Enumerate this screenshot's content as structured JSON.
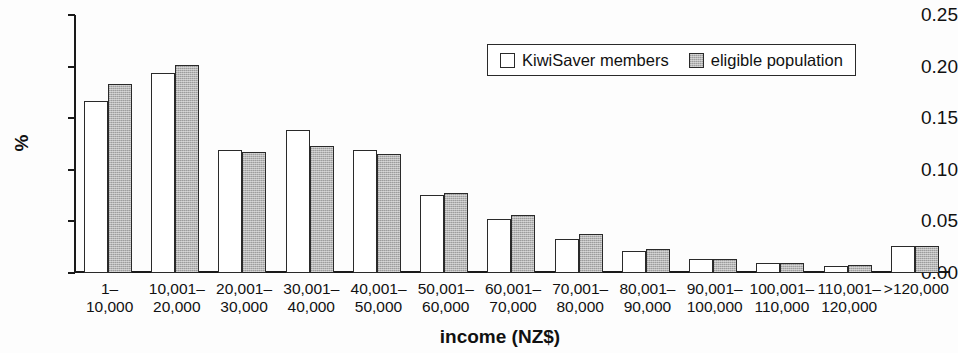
{
  "chart_data": {
    "type": "bar",
    "title": "",
    "xlabel": "income (NZ$)",
    "ylabel": "%",
    "ylim": [
      0.0,
      0.25
    ],
    "ytick_labels": [
      "0.25",
      "0.20",
      "0.15",
      "0.10",
      "0.05",
      "0.00"
    ],
    "ytick_values": [
      0.25,
      0.2,
      0.15,
      0.1,
      0.05,
      0.0
    ],
    "grid": false,
    "legend_position": "upper right inside",
    "categories": [
      "1–\n10,000",
      "10,001–\n20,000",
      "20,001–\n30,000",
      "30,001–\n40,000",
      "40,001–\n50,000",
      "50,001–\n60,000",
      "60,001–\n70,000",
      "70,001–\n80,000",
      "80,001–\n90,000",
      "90,001–\n100,000",
      "100,001–\n110,000",
      "110,001–\n120,000",
      ">120,000"
    ],
    "category_lines": [
      [
        "1–",
        "10,000"
      ],
      [
        "10,001–",
        "20,000"
      ],
      [
        "20,001–",
        "30,000"
      ],
      [
        "30,001–",
        "40,000"
      ],
      [
        "40,001–",
        "50,000"
      ],
      [
        "50,001–",
        "60,000"
      ],
      [
        "60,001–",
        "70,000"
      ],
      [
        "70,001–",
        "80,000"
      ],
      [
        "80,001–",
        "90,000"
      ],
      [
        "90,001–",
        "100,000"
      ],
      [
        "100,001–",
        "110,000"
      ],
      [
        "110,001–",
        "120,000"
      ],
      [
        ">120,000",
        ""
      ]
    ],
    "series": [
      {
        "name": "KiwiSaver members",
        "color": "#ffffff",
        "values": [
          0.167,
          0.194,
          0.119,
          0.139,
          0.119,
          0.076,
          0.052,
          0.033,
          0.021,
          0.014,
          0.01,
          0.007,
          0.026
        ]
      },
      {
        "name": "eligible population",
        "color": "#b5b5b5",
        "values": [
          0.183,
          0.202,
          0.117,
          0.123,
          0.115,
          0.078,
          0.056,
          0.038,
          0.023,
          0.014,
          0.01,
          0.008,
          0.026
        ]
      }
    ]
  },
  "legend": {
    "items": [
      {
        "label": "KiwiSaver members",
        "swatch": "white-square"
      },
      {
        "label": "eligible population",
        "swatch": "gray-square"
      }
    ]
  }
}
